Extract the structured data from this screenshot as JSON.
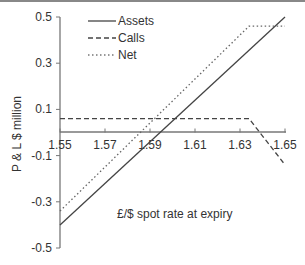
{
  "chart_data": {
    "type": "line",
    "title": "",
    "xlabel": "£/$ spot rate at expiry",
    "ylabel": "P & L $ million",
    "xlim": [
      1.55,
      1.65
    ],
    "ylim": [
      -0.5,
      0.5
    ],
    "x_ticks": [
      "1.55",
      "1.57",
      "1.59",
      "1.61",
      "1.63",
      "1.65"
    ],
    "y_ticks": [
      "0.5",
      "0.3",
      "0.1",
      "-0.1",
      "-0.3",
      "-0.5"
    ],
    "grid": false,
    "legend_position": "upper-left-inside",
    "series": [
      {
        "name": "Assets",
        "style": "solid",
        "color": "#444444",
        "points": [
          [
            1.55,
            -0.4
          ],
          [
            1.65,
            0.5
          ]
        ]
      },
      {
        "name": "Calls",
        "style": "dashed",
        "color": "#444444",
        "points": [
          [
            1.55,
            0.06
          ],
          [
            1.634,
            0.06
          ],
          [
            1.65,
            -0.14
          ]
        ]
      },
      {
        "name": "Net",
        "style": "dotted",
        "color": "#666666",
        "points": [
          [
            1.55,
            -0.34
          ],
          [
            1.634,
            0.46
          ],
          [
            1.65,
            0.46
          ]
        ]
      }
    ]
  },
  "legend": {
    "items": [
      {
        "label": "Assets",
        "style": "solid"
      },
      {
        "label": "Calls",
        "style": "dashed"
      },
      {
        "label": "Net",
        "style": "dotted"
      }
    ]
  },
  "axes": {
    "xlabel": "£/$ spot rate at expiry",
    "ylabel": "P & L $ million",
    "x_ticks": [
      "1.55",
      "1.57",
      "1.59",
      "1.61",
      "1.63",
      "1.65"
    ],
    "y_ticks": [
      "0.5",
      "0.3",
      "0.1",
      "-0.1",
      "-0.3",
      "-0.5"
    ]
  }
}
